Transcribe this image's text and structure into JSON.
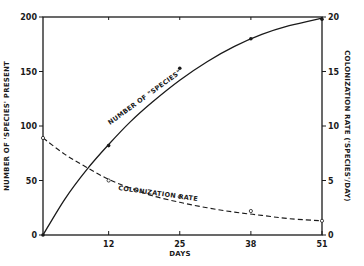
{
  "chart_data": {
    "type": "line",
    "title": "",
    "xlabel": "DAYS",
    "ylabel": "NUMBER OF \"SPECIES\" PRESENT",
    "ylabel_right": "COLONIZATION RATE (\"SPECIES\"/DAY)",
    "x_ticks": [
      0,
      12,
      25,
      38,
      51
    ],
    "x_tick_labels": [
      "0",
      "12",
      "25",
      "38",
      "51"
    ],
    "xlim": [
      0,
      51
    ],
    "ylim": [
      0,
      200
    ],
    "y_ticks": [
      0,
      50,
      100,
      150,
      200
    ],
    "y_tick_labels": [
      "0",
      "50",
      "100",
      "150",
      "200"
    ],
    "ylim_right": [
      0,
      20
    ],
    "y_right_ticks": [
      0,
      5,
      10,
      15,
      20
    ],
    "y_right_tick_labels": [
      "0",
      "5",
      "10",
      "15",
      "20"
    ],
    "grid": false,
    "legend": "none (inline curve labels)",
    "series": [
      {
        "name": "NUMBER OF \"SPECIES\"",
        "axis": "left",
        "style": "solid",
        "marker": "filled-dot",
        "x": [
          0,
          12,
          25,
          38,
          51
        ],
        "values": [
          0,
          82,
          153,
          180,
          198
        ],
        "fit_curve": [
          [
            0,
            0
          ],
          [
            4,
            33
          ],
          [
            8,
            60
          ],
          [
            12,
            83
          ],
          [
            16,
            104
          ],
          [
            20,
            122
          ],
          [
            25,
            142
          ],
          [
            30,
            159
          ],
          [
            35,
            173
          ],
          [
            40,
            184
          ],
          [
            45,
            192
          ],
          [
            51,
            199
          ]
        ]
      },
      {
        "name": "COLONIZATION RATE",
        "axis": "right",
        "style": "dashed",
        "marker": "open-circle",
        "x": [
          0,
          12,
          25,
          38,
          51
        ],
        "values": [
          8.9,
          5.0,
          3.5,
          2.2,
          1.3
        ],
        "fit_curve": [
          [
            0,
            8.9
          ],
          [
            4,
            7.4
          ],
          [
            8,
            6.2
          ],
          [
            12,
            5.1
          ],
          [
            16,
            4.3
          ],
          [
            20,
            3.6
          ],
          [
            25,
            3.0
          ],
          [
            30,
            2.5
          ],
          [
            35,
            2.1
          ],
          [
            40,
            1.8
          ],
          [
            45,
            1.5
          ],
          [
            51,
            1.3
          ]
        ]
      }
    ],
    "annotations": [
      "NUMBER OF \"SPECIES\"",
      "COLONIZATION RATE"
    ]
  },
  "labels": {
    "xlabel": "DAYS",
    "ylabel_left": "NUMBER OF 'SPECIES' PRESENT",
    "ylabel_right": "COLONIZATION RATE ('SPECIES'/DAY)",
    "curve_species": "NUMBER OF \"SPECIES\"",
    "curve_rate": "COLONIZATION RATE"
  },
  "colors": {
    "ink": "#1a1a1a",
    "background": "#ffffff"
  }
}
